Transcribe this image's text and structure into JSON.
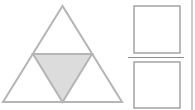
{
  "diagram": {
    "triangle": {
      "subdivisions": 4,
      "shaded_parts": 1,
      "shaded_part": "center"
    },
    "fraction": {
      "numerator": "",
      "denominator": ""
    },
    "colors": {
      "stroke": "#b5b5b5",
      "shade": "#dcdcdc",
      "box_stroke": "#8c8c8c",
      "background": "#ffffff"
    }
  }
}
